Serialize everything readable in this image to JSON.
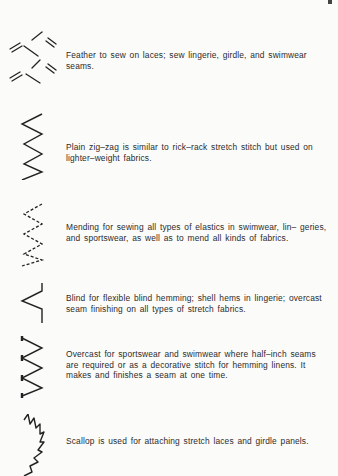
{
  "page": {
    "entries": [
      {
        "stitch": "feather-stitch-icon",
        "text": "Feather to sew on laces; sew lingerie, girdle, and swimwear seams."
      },
      {
        "stitch": "plain-zigzag-stitch-icon",
        "text": "Plain zig–zag is similar to rick–rack stretch stitch but used on lighter–weight fabrics."
      },
      {
        "stitch": "mending-stitch-icon",
        "text": "Mending for sewing all types of elastics in swimwear, lin– geries, and sportswear, as well as to mend all kinds of fabrics."
      },
      {
        "stitch": "blind-stitch-icon",
        "text": "Blind for flexible blind hemming; shell hems in lingerie; overcast seam finishing on all types of stretch fabrics."
      },
      {
        "stitch": "overcast-stitch-icon",
        "text": "Overcast for sportswear and swimwear where half–inch seams are required or as a decorative stitch for hemming linens. It makes and finishes a seam at one time."
      },
      {
        "stitch": "scallop-stitch-icon",
        "text": "Scallop is used for attaching stretch laces and girdle panels."
      }
    ]
  }
}
